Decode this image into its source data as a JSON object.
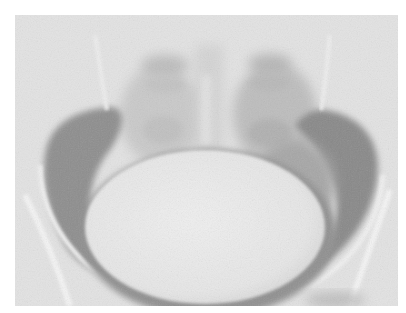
{
  "image": {
    "kind": "radiograph",
    "subject": "pelvis",
    "modality": "x-ray",
    "grayscale": true,
    "frame": {
      "x": 15,
      "y": 15,
      "width": 383,
      "height": 291
    },
    "background_color": "#ffffff",
    "palette": {
      "film_base": "#e4e4e4",
      "bone_bright": "#f2f2f2",
      "cavity_dark": "#8a8a8a",
      "cavity_mid": "#a6a6a6",
      "bladder_contrast": "#eaeaea",
      "soft_tissue": "#c8c8c8"
    },
    "regions": [
      {
        "name": "bladder-contrast",
        "shape": "ellipse",
        "cx": 193,
        "cy": 218,
        "rx": 125,
        "ry": 82
      },
      {
        "name": "left-pelvic-cavity",
        "shape": "crescent",
        "side": "left"
      },
      {
        "name": "right-pelvic-cavity",
        "shape": "crescent",
        "side": "right"
      },
      {
        "name": "sacrum",
        "shape": "vertical-band",
        "cx": 193
      },
      {
        "name": "left-sacroiliac",
        "side": "left"
      },
      {
        "name": "right-sacroiliac",
        "side": "right"
      },
      {
        "name": "pelvic-brim",
        "shape": "arc"
      }
    ]
  }
}
